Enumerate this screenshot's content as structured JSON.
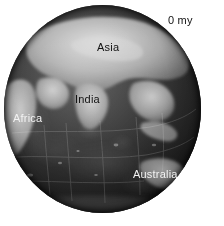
{
  "figure": {
    "type": "globe-map",
    "projection": "orthographic",
    "view_center": "Indian Ocean",
    "background_color": "#ffffff",
    "age_label": "0 my",
    "age_value": 0,
    "age_units": "my",
    "label_dark_color": "#121212",
    "label_light_color": "#f2f2f2"
  },
  "globe": {
    "name": "earth-globe",
    "center_x": 103,
    "center_y": 109,
    "radius": 99,
    "palette": "grayscale-topography",
    "ocean_color": "#2a2a2a",
    "land_color": "#9a9a9a"
  },
  "labels": [
    {
      "id": "age",
      "text": "0 my",
      "tone": "dark"
    },
    {
      "id": "asia",
      "text": "Asia",
      "tone": "dark"
    },
    {
      "id": "india",
      "text": "India",
      "tone": "dark"
    },
    {
      "id": "africa",
      "text": "Africa",
      "tone": "light"
    },
    {
      "id": "australia",
      "text": "Australia",
      "tone": "light"
    }
  ]
}
